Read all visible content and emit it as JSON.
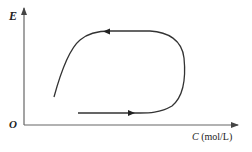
{
  "diagram": {
    "type": "cycle-curve",
    "y_axis_label": "E",
    "origin_label": "O",
    "x_axis_label_var": "C",
    "x_axis_label_unit": " (mol/L)",
    "colors": {
      "axis": "#555555",
      "curve": "#333333",
      "text": "#222222"
    }
  }
}
